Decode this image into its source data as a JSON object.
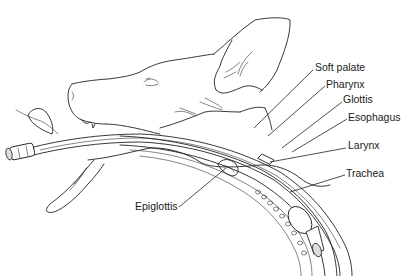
{
  "figure": {
    "labels": {
      "soft_palate": "Soft palate",
      "pharynx": "Pharynx",
      "glottis": "Glottis",
      "esophagus": "Esophagus",
      "larynx": "Larynx",
      "trachea": "Trachea",
      "epiglottis": "Epiglottis"
    }
  },
  "colors": {
    "background": "#ffffff",
    "line": "#222222",
    "text": "#1a1a1a"
  }
}
